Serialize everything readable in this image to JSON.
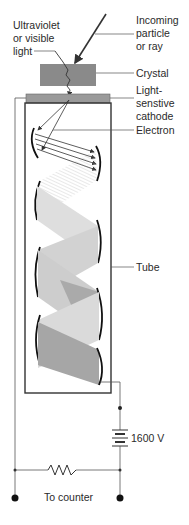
{
  "diagram": {
    "labels": {
      "incoming": [
        "Incoming",
        "particle",
        "or ray"
      ],
      "light": [
        "Ultraviolet",
        "or visible",
        "light"
      ],
      "crystal": "Crystal",
      "cathode": [
        "Light-",
        "senstive",
        "cathode"
      ],
      "electron": "Electron",
      "tube": "Tube",
      "voltage": "1600 V",
      "counter": "To counter"
    },
    "colors": {
      "crystal": "#8a8a8a",
      "cathode": "#9a9a9a",
      "line": "#333333",
      "beam_light": "#d8d8d8",
      "beam_mid": "#b8b8b8",
      "beam_dark": "#9c9c9c"
    }
  }
}
